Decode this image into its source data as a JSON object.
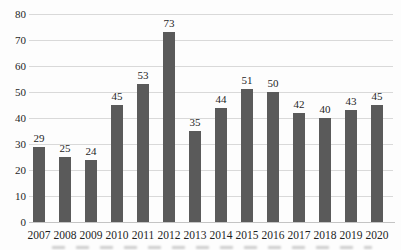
{
  "chart_data": {
    "type": "bar",
    "categories": [
      "2007",
      "2008",
      "2009",
      "2010",
      "2011",
      "2012",
      "2013",
      "2014",
      "2015",
      "2016",
      "2017",
      "2018",
      "2019",
      "2020"
    ],
    "values": [
      29,
      25,
      24,
      45,
      53,
      73,
      35,
      44,
      51,
      50,
      42,
      40,
      43,
      45
    ],
    "title": "",
    "xlabel": "",
    "ylabel": "",
    "ylim": [
      0,
      80
    ],
    "ytick_step": 10,
    "ytick_labels": [
      "0",
      "10",
      "20",
      "30",
      "40",
      "50",
      "60",
      "70",
      "80"
    ],
    "grid": true,
    "legend": "none",
    "data_labels": true,
    "colors": {
      "bar": "#5a5a5a",
      "gridline": "#d9d9d9",
      "axis_line": "#c4c4c4",
      "text": "#1f1f1f",
      "background": "#fdfdfd"
    }
  }
}
